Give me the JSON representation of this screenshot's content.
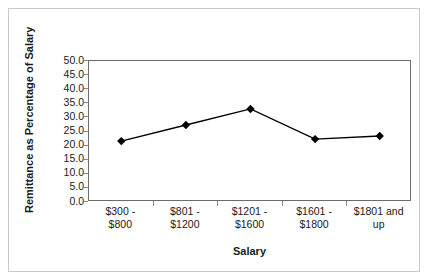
{
  "chart_data": {
    "type": "line",
    "title": "",
    "xlabel": "Salary",
    "ylabel": "Remittance as Percentage of Salary",
    "categories": [
      "$300 - $800",
      "$801 - $1200",
      "$1201 - $1600",
      "$1601 - $1800",
      "$1801 and up"
    ],
    "category_lines": [
      [
        "$300 -",
        "$800"
      ],
      [
        "$801 -",
        "$1200"
      ],
      [
        "$1201 -",
        "$1600"
      ],
      [
        "$1601 -",
        "$1800"
      ],
      [
        "$1801 and",
        "up"
      ]
    ],
    "values": [
      21.6,
      27.3,
      33.0,
      22.3,
      23.4
    ],
    "ylim": [
      0.0,
      50.0
    ],
    "ytick_step": 5.0,
    "ytick_labels": [
      "50.0",
      "45.0",
      "40.0",
      "35.0",
      "30.0",
      "25.0",
      "20.0",
      "15.0",
      "10.0",
      "5.0",
      "0.0"
    ],
    "ytick_values": [
      50.0,
      45.0,
      40.0,
      35.0,
      30.0,
      25.0,
      20.0,
      15.0,
      10.0,
      5.0,
      0.0
    ],
    "grid": false,
    "legend": "none",
    "marker": "diamond",
    "series_color": "#000000",
    "plot_border_color": "#6b6b6b",
    "figure_border_color": "#c9c9c9",
    "background": "#ffffff"
  }
}
